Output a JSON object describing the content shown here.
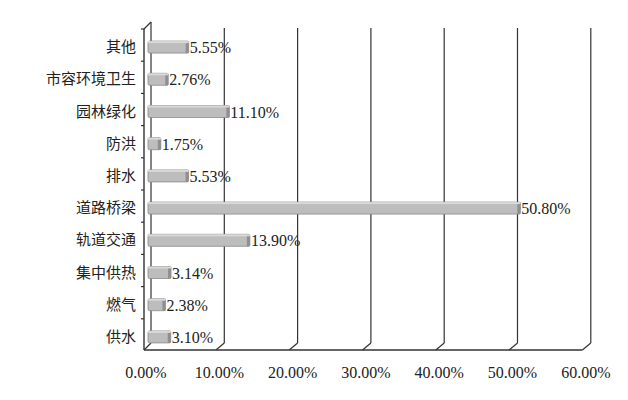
{
  "chart_data": {
    "type": "bar",
    "orientation": "horizontal",
    "style": "3d",
    "title": "",
    "xlabel": "",
    "ylabel": "",
    "categories": [
      "其他",
      "市容环境卫生",
      "园林绿化",
      "防洪",
      "排水",
      "道路桥梁",
      "轨道交通",
      "集中供热",
      "燃气",
      "供水"
    ],
    "values": [
      5.55,
      2.76,
      11.1,
      1.75,
      5.53,
      50.8,
      13.9,
      3.14,
      2.38,
      3.1
    ],
    "value_labels": [
      "5.55%",
      "2.76%",
      "11.10%",
      "1.75%",
      "5.53%",
      "50.80%",
      "13.90%",
      "3.14%",
      "2.38%",
      "3.10%"
    ],
    "xlim": [
      0,
      60
    ],
    "x_ticks": [
      "0.00%",
      "10.00%",
      "20.00%",
      "30.00%",
      "40.00%",
      "50.00%",
      "60.00%"
    ],
    "grid": true,
    "legend": null,
    "colors": {
      "bar": "#bdbdbd",
      "bar_edge": "#8a8a8a",
      "grid": "#333333",
      "text": "#222222"
    }
  }
}
